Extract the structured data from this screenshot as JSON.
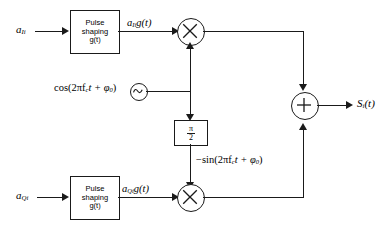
{
  "diagram": {
    "inputs": {
      "i_branch": "a",
      "i_branch_sub": "Ii",
      "q_branch": "a",
      "q_branch_sub": "Qi"
    },
    "blocks": {
      "pulse_shaping_line1": "Pulse",
      "pulse_shaping_line2": "shaping",
      "pulse_shaping_line3": "g(t)",
      "phase_shift_numerator": "π",
      "phase_shift_denominator": "2"
    },
    "signals": {
      "i_shaped": "g(t)",
      "i_shaped_prefix": "a",
      "i_shaped_sub": "Ii",
      "q_shaped": "g(t)",
      "q_shaped_prefix": "a",
      "q_shaped_sub": "Qi",
      "carrier_cos": "cos(2πf",
      "carrier_cos_sub": "c",
      "carrier_cos_tail": "t + φ",
      "carrier_cos_phase_sub": "0",
      "carrier_cos_close": ")",
      "carrier_sin": "−sin(2πf",
      "carrier_sin_sub": "c",
      "carrier_sin_tail": "t + φ",
      "carrier_sin_phase_sub": "0",
      "carrier_sin_close": ")",
      "output": "S",
      "output_sub": "i",
      "output_tail": "(t)"
    },
    "operators": {
      "multiply": "×",
      "sum": "+",
      "oscillator": "sine-wave-source"
    },
    "colors": {
      "line": "#1a1a1a",
      "background": "#ffffff"
    }
  }
}
